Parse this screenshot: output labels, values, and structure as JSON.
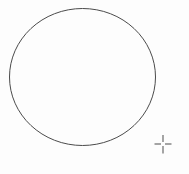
{
  "canvas": {
    "width": 189,
    "height": 174,
    "background_color": "#fdfdfd"
  },
  "shapes": {
    "circle": {
      "kind": "ellipse-outline",
      "cx": 82.5,
      "cy": 77,
      "rx": 73,
      "ry": 68.5,
      "stroke_color": "#4b4b4b",
      "stroke_width": 1,
      "fill": "none"
    }
  },
  "cursor": {
    "kind": "crosshair",
    "x": 163,
    "y": 144,
    "color": "#8e8e8e",
    "thickness": 1.6,
    "segments": [
      {
        "x1": 154.5,
        "y1": 144,
        "x2": 161,
        "y2": 144
      },
      {
        "x1": 165,
        "y1": 144,
        "x2": 171.5,
        "y2": 144
      },
      {
        "x1": 163,
        "y1": 135,
        "x2": 163,
        "y2": 142
      },
      {
        "x1": 163,
        "y1": 146,
        "x2": 163,
        "y2": 153.5
      }
    ]
  }
}
